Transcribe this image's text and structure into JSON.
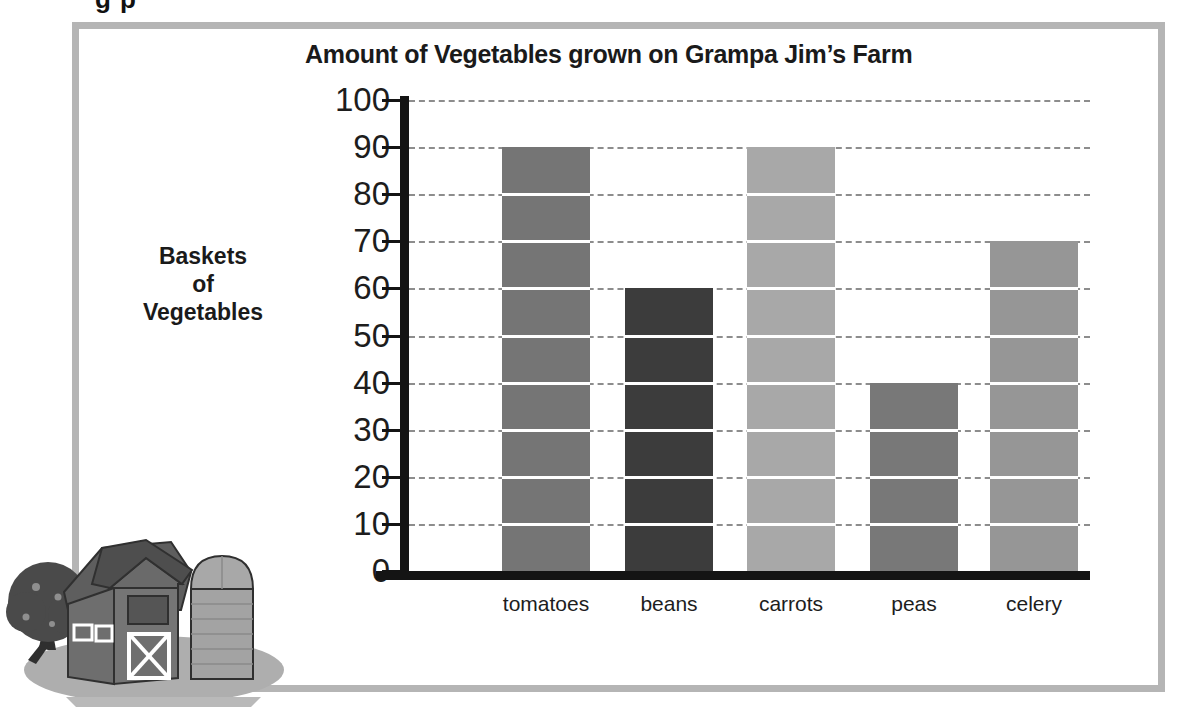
{
  "page": {
    "top_remnant": "g p",
    "frame_color": "#b5b5b5",
    "background": "#ffffff"
  },
  "illustration": {
    "name": "farm-barn-silo-tree",
    "barn_color": "#6e6e6e",
    "roof_color": "#5a5a5a",
    "silo_color": "#a3a3a3",
    "tree_color": "#4a4a4a",
    "ground_color": "#a8a8a8"
  },
  "chart_data": {
    "type": "bar",
    "title": "Amount of Vegetables grown on Grampa Jim’s Farm",
    "xlabel": "Types of Vegetables",
    "ylabel": "Baskets of Vegetables",
    "ylabel_lines": [
      "Baskets",
      "of",
      "Vegetables"
    ],
    "categories": [
      "tomatoes",
      "beans",
      "carrots",
      "peas",
      "celery"
    ],
    "values": [
      90,
      60,
      90,
      40,
      70
    ],
    "colors": [
      "#757575",
      "#3c3c3c",
      "#a8a8a8",
      "#787878",
      "#969696"
    ],
    "ylim": [
      0,
      100
    ],
    "ytick_labels": [
      "100",
      "90",
      "80",
      "70",
      "60",
      "50",
      "40",
      "30",
      "20",
      "10",
      "0"
    ],
    "ytick_values": [
      100,
      90,
      80,
      70,
      60,
      50,
      40,
      30,
      20,
      10,
      0
    ],
    "ystep": 10,
    "grid": true,
    "grid_style": "dashed",
    "grid_color": "#8d8d8d",
    "axis_color": "#141414",
    "legend": null
  }
}
